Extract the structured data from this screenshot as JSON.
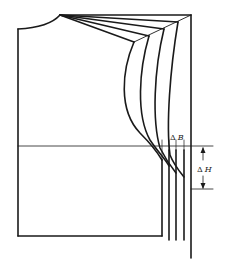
{
  "diagram": {
    "type": "pattern-drafting",
    "stroke_color": "#1a1a1a",
    "background": "#ffffff",
    "labels": {
      "delta_b": {
        "symbol": "Δ",
        "variable": "B"
      },
      "delta_h": {
        "symbol": "Δ",
        "variable": "H"
      }
    },
    "graded_lines_count": 4
  }
}
